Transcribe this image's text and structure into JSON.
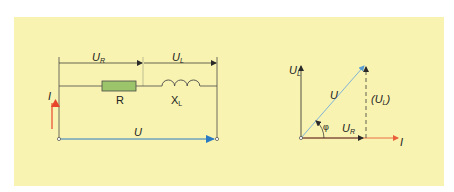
{
  "diagram": {
    "colors": {
      "background": "#f8f3b0",
      "wire": "#4a4a4a",
      "resistor_fill": "#9cc46a",
      "voltage_arrow": "#2a7bc4",
      "current_arrow": "#e8452a",
      "phasor_u": "#7fb3d8"
    },
    "circuit": {
      "voltage_resistor_label": "U",
      "voltage_resistor_sub": "R",
      "voltage_inductor_label": "U",
      "voltage_inductor_sub": "L",
      "resistor_label": "R",
      "inductor_label": "X",
      "inductor_sub": "L",
      "current_label": "I",
      "total_voltage_label": "U"
    },
    "phasor": {
      "vertical_axis_label": "U",
      "vertical_axis_sub": "L",
      "horizontal_axis_label": "I",
      "resultant_label": "U",
      "resistor_voltage_label": "U",
      "resistor_voltage_sub": "R",
      "inductor_voltage_label_open": "(U",
      "inductor_voltage_sub": "L",
      "inductor_voltage_label_close": ")",
      "angle_label": "φ"
    }
  }
}
